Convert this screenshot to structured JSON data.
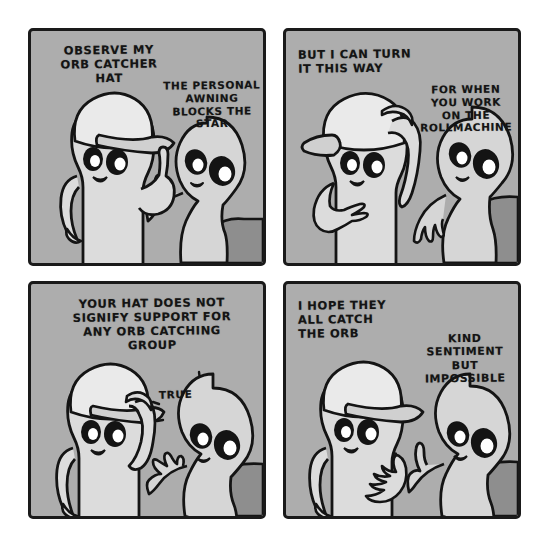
{
  "comic": {
    "title": "Orb Catcher Hat",
    "background_color": "#ffffff",
    "panel_background": "#adadad",
    "ink_color": "#141414",
    "body_fill": "#d8d8d8",
    "shadow_fill": "#8e8e8e",
    "panels": [
      {
        "id": "panel-1",
        "number": "1",
        "lines": [
          {
            "id": "p1-line-a",
            "speaker": "hat-character",
            "text": "OBSERVE MY\nORB CATCHER\nHAT",
            "align": "center"
          },
          {
            "id": "p1-line-b",
            "speaker": "egg-character",
            "text": "THE PERSONAL\nAWNING\nBLOCKS THE\nSTAR",
            "align": "center"
          }
        ],
        "characters": [
          {
            "name": "hat-character",
            "pose": "hand-on-hip-pointing-up"
          },
          {
            "name": "egg-character",
            "pose": "pointing-finger"
          }
        ]
      },
      {
        "id": "panel-2",
        "number": "2",
        "lines": [
          {
            "id": "p2-line-a",
            "speaker": "hat-character",
            "text": "BUT I CAN TURN\nIT THIS WAY",
            "align": "left"
          },
          {
            "id": "p2-line-b",
            "speaker": "egg-character",
            "text": "FOR WHEN\nYOU WORK\nON THE\nROLLMACHINE",
            "align": "center"
          }
        ],
        "characters": [
          {
            "name": "hat-character",
            "pose": "hand-adjusting-cap-backwards"
          },
          {
            "name": "egg-character",
            "pose": "hand-lowered"
          }
        ]
      },
      {
        "id": "panel-3",
        "number": "3",
        "lines": [
          {
            "id": "p3-line-a",
            "speaker": "egg-character",
            "text": "YOUR HAT DOES NOT\nSIGNIFY SUPPORT FOR\nANY ORB CATCHING\nGROUP",
            "align": "center"
          },
          {
            "id": "p3-line-b",
            "speaker": "hat-character",
            "text": "TRUE",
            "align": "left"
          }
        ],
        "characters": [
          {
            "name": "hat-character",
            "pose": "hand-touching-cap-brim"
          },
          {
            "name": "egg-character",
            "pose": "open-palm-gesture"
          }
        ]
      },
      {
        "id": "panel-4",
        "number": "4",
        "lines": [
          {
            "id": "p4-line-a",
            "speaker": "hat-character",
            "text": "I HOPE THEY\nALL CATCH\nTHE ORB",
            "align": "left"
          },
          {
            "id": "p4-line-b",
            "speaker": "egg-character",
            "text": "KIND\nSENTIMENT\nBUT\nIMPOSSIBLE",
            "align": "center"
          }
        ],
        "characters": [
          {
            "name": "hat-character",
            "pose": "hand-on-chest"
          },
          {
            "name": "egg-character",
            "pose": "pointing-finger"
          }
        ]
      }
    ]
  }
}
